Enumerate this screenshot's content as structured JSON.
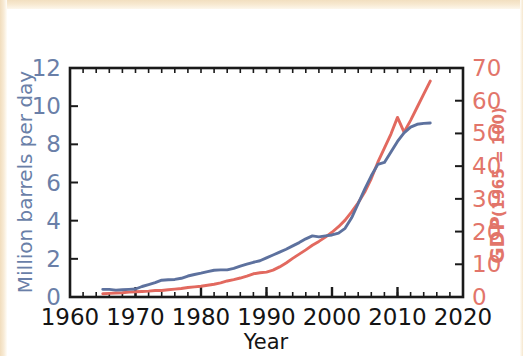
{
  "figure": {
    "background_color": "#ffffff",
    "scan_border_color": "#f4e3c6",
    "plot_frame_color": "#1a1a1a"
  },
  "axes": {
    "x": {
      "label": "Year",
      "label_color": "#141414",
      "ticks": [
        "1960",
        "1970",
        "1980",
        "1990",
        "2000",
        "2010",
        "2020"
      ],
      "min": 1960,
      "max": 2020,
      "minor_tick_step": 2
    },
    "y_left": {
      "label": "Million barrels per day",
      "color": "#6a7fa8",
      "ticks": [
        "0",
        "2",
        "4",
        "6",
        "8",
        "10",
        "12"
      ],
      "min": 0,
      "max": 12
    },
    "y_right": {
      "label_main": "GDP",
      "label_paren": "(1965 = 100)",
      "label_full": "GDP (1965 = 100)",
      "color": "#e2756a",
      "ticks": [
        "0",
        "10",
        "20",
        "30",
        "40",
        "50",
        "60",
        "70"
      ],
      "min": 0,
      "max": 70
    }
  },
  "chart_data": {
    "type": "line",
    "title": "",
    "xlabel": "Year",
    "ylabel": "Million barrels per day",
    "y2label": "GDP (1965 = 100)",
    "xlim": [
      1960,
      2020
    ],
    "ylim": [
      0,
      12
    ],
    "y2lim": [
      0,
      70
    ],
    "grid": false,
    "legend": "none",
    "x": [
      1965,
      1966,
      1967,
      1968,
      1969,
      1970,
      1971,
      1972,
      1973,
      1974,
      1975,
      1976,
      1977,
      1978,
      1979,
      1980,
      1981,
      1982,
      1983,
      1984,
      1985,
      1986,
      1987,
      1988,
      1989,
      1990,
      1991,
      1992,
      1993,
      1994,
      1995,
      1996,
      1997,
      1998,
      1999,
      2000,
      2001,
      2002,
      2003,
      2004,
      2005,
      2006,
      2007,
      2008,
      2009,
      2010,
      2011,
      2012,
      2013,
      2014,
      2015
    ],
    "series": [
      {
        "name": "Oil consumption",
        "axis": "left",
        "color": "#5d719e",
        "unit": "Million barrels per day",
        "values": [
          0.4,
          0.4,
          0.36,
          0.38,
          0.4,
          0.42,
          0.55,
          0.65,
          0.75,
          0.88,
          0.9,
          0.92,
          0.98,
          1.1,
          1.18,
          1.25,
          1.33,
          1.4,
          1.42,
          1.42,
          1.5,
          1.62,
          1.72,
          1.82,
          1.9,
          2.05,
          2.2,
          2.35,
          2.5,
          2.68,
          2.85,
          3.05,
          3.2,
          3.15,
          3.2,
          3.25,
          3.35,
          3.6,
          4.15,
          4.9,
          5.65,
          6.35,
          6.95,
          7.05,
          7.6,
          8.15,
          8.6,
          8.9,
          9.05,
          9.1,
          9.12
        ]
      },
      {
        "name": "GDP index",
        "axis": "right",
        "color": "#e2695f",
        "unit": "GDP (1965 = 100)",
        "values": [
          1.0,
          1.1,
          1.2,
          1.3,
          1.5,
          1.6,
          1.7,
          1.8,
          2.0,
          2.0,
          2.2,
          2.4,
          2.6,
          2.9,
          3.1,
          3.3,
          3.6,
          3.9,
          4.3,
          4.9,
          5.3,
          5.8,
          6.4,
          7.1,
          7.4,
          7.6,
          8.2,
          9.2,
          10.4,
          11.8,
          13.1,
          14.4,
          15.8,
          17.0,
          18.3,
          19.8,
          21.5,
          23.5,
          26.0,
          28.8,
          32.1,
          36.2,
          41.2,
          45.5,
          49.8,
          54.9,
          50.4,
          54.0,
          58.0,
          62.0,
          66.0
        ]
      }
    ]
  }
}
